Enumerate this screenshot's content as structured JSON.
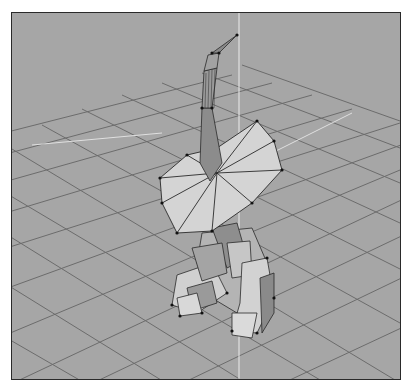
{
  "viewport": {
    "view": "perspective",
    "background_color": "#a6a6a6",
    "grid_color": "#6e6e6e",
    "mesh_face_light": "#d4d4d4",
    "mesh_face_mid": "#b8b8b8",
    "mesh_face_dark": "#8c8c8c",
    "edge_color": "#2a2a2a",
    "axis_color": "#e8e8e8",
    "object": "low-poly creature model with tall curved head and flat fan collar, wireframe on shaded"
  }
}
